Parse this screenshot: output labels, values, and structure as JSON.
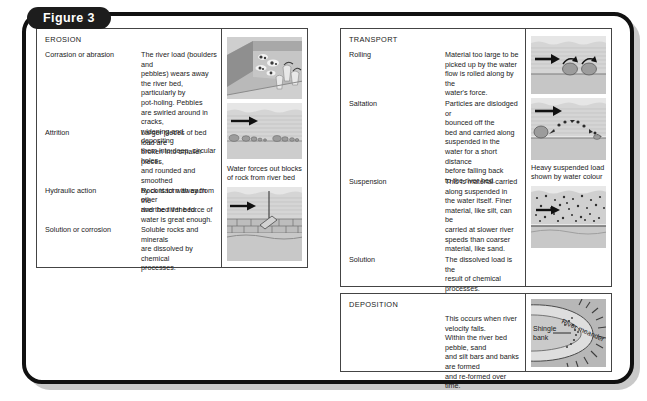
{
  "figure": {
    "label": "Figure 3"
  },
  "erosion": {
    "heading": "EROSION",
    "rows": [
      {
        "term": "Corrasion or abrasion",
        "desc": "The river load (boulders and\npebbles) wears away\nthe river bed, particularly by\npot-holing. Pebbles\nare swirled around in cracks,\nwidening and depositing\nthem into deep, circular holes."
      },
      {
        "term": "Attrition",
        "desc": "Larger pieces of bed load are\nbroken into smaller pieces,\nand rounded and smoothed\nby contact with each other\nand the river bed."
      },
      {
        "term": "Hydraulic action",
        "desc": "Rock is torn away from the\nriver bed if the force of\nwater is great enough."
      },
      {
        "term": "Solution or corrosion",
        "desc": "Soluble rocks and minerals\nare dissolved by chemical\nprocesses."
      }
    ],
    "captions": {
      "hydraulic": "Water forces out blocks\nof rock from river bed"
    }
  },
  "transport": {
    "heading": "TRANSPORT",
    "rows": [
      {
        "term": "Rolling",
        "desc": "Material too large to be\npicked up by the water\nflow is rolled along by the\nwater's force."
      },
      {
        "term": "Saltation",
        "desc": "Particles are dislodged or\nbounced off the\nbed and carried along\nsuspended in the\nwater for a short distance\nbefore falling back\nto the river bed."
      },
      {
        "term": "Suspension",
        "desc": "This is material carried\nalong suspended in\nthe water itself. Finer\nmaterial, like silt, can be\ncarried at slower river\nspeeds than coarser\nmaterial, like sand."
      },
      {
        "term": "Solution",
        "desc": "The dissolved load is the\nresult of chemical\nprocesses."
      }
    ],
    "captions": {
      "suspension": "Heavy suspended load\nshown by water colour"
    }
  },
  "deposition": {
    "heading": "DEPOSITION",
    "desc": "This occurs when river velocity falls.\nWithin the river bed pebble, sand\nand silt bars and banks are formed\nand re-formed over time.",
    "labels": {
      "meander": "River meander",
      "shingle": "Shingle\nbank"
    }
  },
  "colors": {
    "frame": "#111111",
    "shadow": "#c9c9c9",
    "pill": "#1d1d1d",
    "rule": "#444444",
    "water": "#d8d8d8",
    "bed": "#b5b5b5",
    "rock": "#9a9a9a"
  }
}
